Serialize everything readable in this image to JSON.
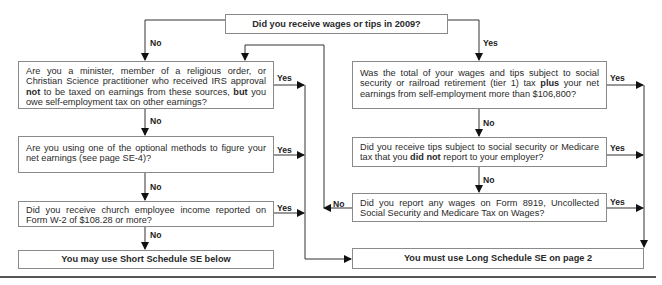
{
  "flowchart": {
    "start": {
      "text": "Did you receive wages or tips in 2009?"
    },
    "left": {
      "q1": {
        "parts": [
          "Are you a minister, member of a religious order, or Christian Science practitioner who received IRS approval ",
          "not",
          " to be taxed on earnings from these sources, ",
          "but",
          " you owe self-employment tax on other earnings?"
        ]
      },
      "q2": {
        "text": "Are you using one of the optional methods to figure your net earnings (see page SE-4)?"
      },
      "q3": {
        "text": "Did you receive church employee income reported on Form W-2 of $108.28 or more?"
      },
      "result": {
        "text": "You may use Short Schedule SE below"
      }
    },
    "right": {
      "q1": {
        "parts": [
          "Was the total of your wages and tips subject to social security or railroad retirement (tier 1) tax ",
          "plus",
          " your net earnings from self-employment more than $106,800?"
        ]
      },
      "q2": {
        "parts": [
          "Did you receive tips subject to social security or Medicare tax that you ",
          "did not",
          " report to your employer?"
        ]
      },
      "q3": {
        "text": "Did you report any wages on Form 8919, Uncollected Social Security and Medicare Tax on Wages?"
      },
      "result": {
        "text": "You must use Long Schedule SE on page 2"
      }
    },
    "labels": {
      "yes": "Yes",
      "no": "No"
    }
  }
}
